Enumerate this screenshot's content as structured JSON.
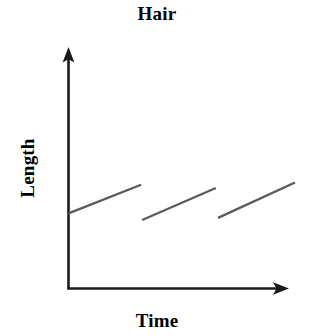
{
  "chart_data": {
    "type": "line",
    "title": "Hair",
    "xlabel": "Time",
    "ylabel": "Length",
    "grid": false,
    "legend": null,
    "tick_labels": {
      "x": [],
      "y": []
    },
    "axis_style": {
      "x_axis_arrow": true,
      "y_axis_arrow": true,
      "axis_color": "#1a1a1a",
      "series_color": "#5a5a5a",
      "background": "#ffffff"
    },
    "xlim": [
      0,
      10
    ],
    "ylim": [
      0,
      10
    ],
    "series": [
      {
        "name": "Hair length",
        "color": "#5a5a5a",
        "segments": [
          {
            "name": "growth-segment-1",
            "x": [
              0.0,
              3.3
            ],
            "y": [
              3.4,
              4.7
            ]
          },
          {
            "name": "growth-segment-2",
            "x": [
              3.35,
              6.7
            ],
            "y": [
              3.1,
              4.55
            ]
          },
          {
            "name": "growth-segment-3",
            "x": [
              6.8,
              10.3
            ],
            "y": [
              3.2,
              4.8
            ]
          }
        ]
      }
    ]
  },
  "figure": {
    "title": "Hair",
    "xlabel": "Time",
    "ylabel": "Length"
  }
}
